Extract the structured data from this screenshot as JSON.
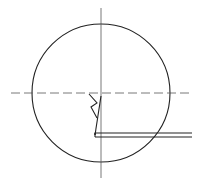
{
  "diagram": {
    "type": "technical-drawing",
    "colors": {
      "background": "#ffffff",
      "outline": "#222222",
      "centerline": "#555555"
    },
    "circle": {
      "cx": 101,
      "cy": 93,
      "r": 69
    },
    "horizontal_centerline": {
      "x1": 11,
      "x2": 192,
      "y": 93,
      "style": "dashed"
    },
    "vertical_centerline": {
      "x": 101,
      "y1": 8,
      "y2": 178,
      "style": "thin"
    },
    "leader_symbol": {
      "stem": [
        [
          95,
          135
        ],
        [
          101,
          96
        ]
      ],
      "zigzag": [
        [
          89,
          94
        ],
        [
          97,
          103
        ],
        [
          91,
          107
        ],
        [
          97,
          118
        ]
      ]
    },
    "double_line": {
      "x1": 95,
      "x2": 192,
      "y_top": 133,
      "y_bottom": 137
    }
  }
}
